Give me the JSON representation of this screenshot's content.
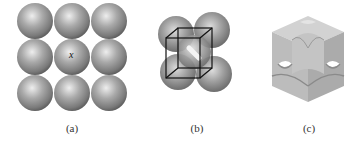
{
  "figure": {
    "panels": [
      {
        "id": "a",
        "caption": "(a)",
        "description": "3x3 square array of close-touching spheres",
        "center_label": "x",
        "rows": 3,
        "cols": 3
      },
      {
        "id": "b",
        "caption": "(b)",
        "description": "Cluster of spheres with wireframe cube unit cell"
      },
      {
        "id": "c",
        "caption": "(c)",
        "description": "Unit cell cube showing sphere sections at corners and faces"
      }
    ],
    "colors": {
      "sphere_light": "#e6e6e6",
      "sphere_mid": "#a8a8a8",
      "sphere_dark": "#6e6e6e",
      "cube_line": "#111111",
      "cell_face_top": "#cfcfcf",
      "cell_face_left": "#b9b9b9",
      "cell_face_right": "#a9a9a9",
      "caption": "#333333"
    }
  }
}
